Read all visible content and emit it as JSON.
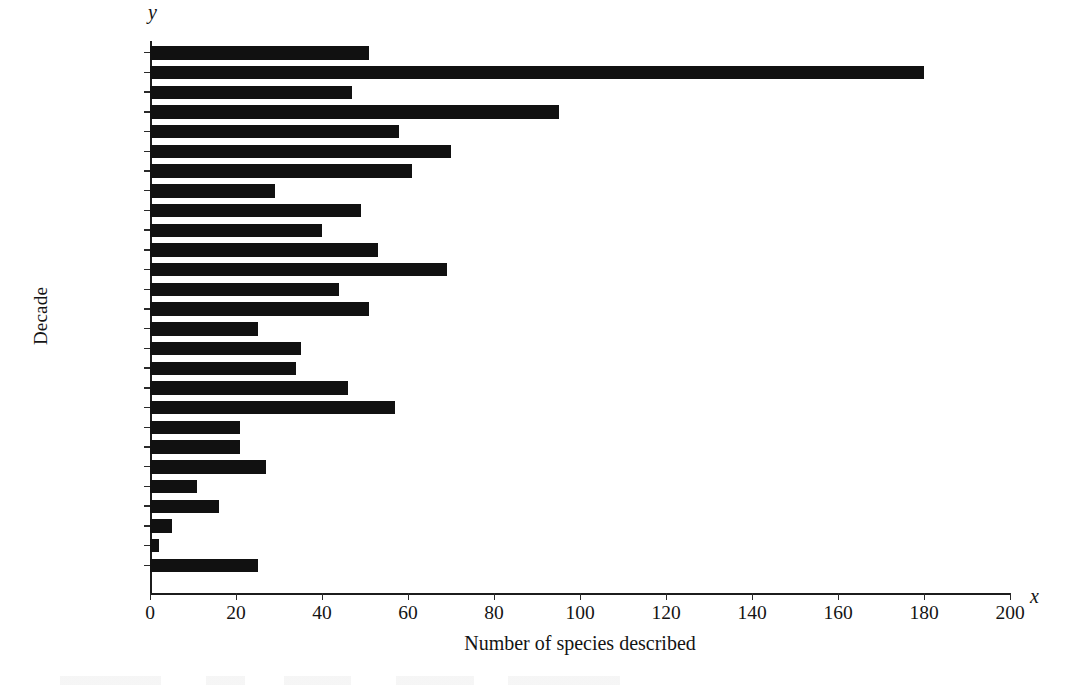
{
  "chart_data": {
    "type": "bar",
    "orientation": "horizontal",
    "title": "",
    "xlabel": "Number of species described",
    "ylabel": "Decade",
    "x_axis_symbol": "x",
    "y_axis_symbol": "y",
    "xlim": [
      0,
      200
    ],
    "xticks": [
      0,
      20,
      40,
      60,
      80,
      100,
      120,
      140,
      160,
      180,
      200
    ],
    "xtick_labels": [
      "0",
      "20",
      "40",
      "60",
      "80",
      "100",
      "120",
      "140",
      "160",
      "180",
      "200"
    ],
    "grid": false,
    "legend": null,
    "bar_color": "#111111",
    "axis_color": "#1c1c1c",
    "categories": [
      "2010 to…",
      "2000 to…",
      "1990 to…",
      "1980 to…",
      "1970 to…",
      "1960 to…",
      "1950 to…",
      "1940 to…",
      "1930 to…",
      "1920 to…",
      "1910 to…",
      "1900 to…",
      "1890 to…",
      "1880 to…",
      "1870 to…",
      "1860 to…",
      "1850 to…",
      "1840 to…",
      "1830 to…",
      "1820 to…",
      "1810 to…",
      "1800 to…",
      "1790 to…",
      "1780 to…",
      "1770 to…",
      "1760 to…",
      "1750 to…"
    ],
    "values": [
      51,
      180,
      47,
      95,
      58,
      70,
      61,
      29,
      49,
      40,
      53,
      69,
      44,
      51,
      25,
      35,
      34,
      46,
      57,
      21,
      21,
      27,
      11,
      16,
      5,
      2,
      25
    ]
  }
}
